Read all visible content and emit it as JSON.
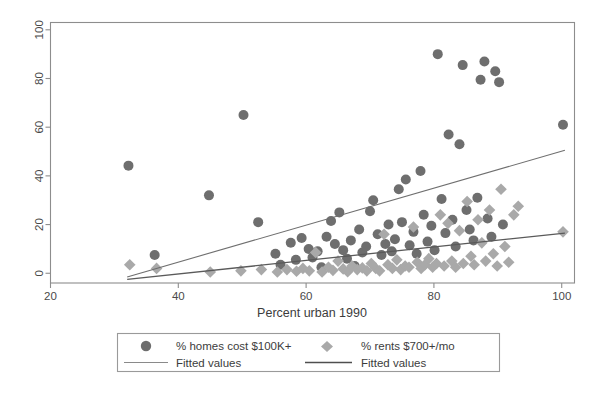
{
  "chart_data": {
    "type": "scatter",
    "title": "",
    "xlabel": "Percent urban 1990",
    "ylabel": "",
    "xlim": [
      20,
      102
    ],
    "ylim": [
      -4,
      103
    ],
    "xticks": [
      20,
      40,
      60,
      80,
      100
    ],
    "yticks": [
      0,
      20,
      40,
      60,
      80,
      100
    ],
    "grid": false,
    "legend_position": "below-plot",
    "series": [
      {
        "name": "% homes cost $100K+",
        "marker": "circle",
        "color": "#6e6e6e",
        "points": [
          [
            32.2,
            44.2
          ],
          [
            36.3,
            7.5
          ],
          [
            44.8,
            32.0
          ],
          [
            50.2,
            65.0
          ],
          [
            52.5,
            21.0
          ],
          [
            55.2,
            8.0
          ],
          [
            56.0,
            3.5
          ],
          [
            57.6,
            12.5
          ],
          [
            58.4,
            5.5
          ],
          [
            59.3,
            14.5
          ],
          [
            60.4,
            10.0
          ],
          [
            61.0,
            6.5
          ],
          [
            61.8,
            9.0
          ],
          [
            62.4,
            2.5
          ],
          [
            63.2,
            15.0
          ],
          [
            63.9,
            21.5
          ],
          [
            64.5,
            12.0
          ],
          [
            65.2,
            25.0
          ],
          [
            65.8,
            9.5
          ],
          [
            66.4,
            6.0
          ],
          [
            67.0,
            13.5
          ],
          [
            67.6,
            3.0
          ],
          [
            68.3,
            18.0
          ],
          [
            68.8,
            8.5
          ],
          [
            69.4,
            11.0
          ],
          [
            70.0,
            25.5
          ],
          [
            70.5,
            30.0
          ],
          [
            71.2,
            16.0
          ],
          [
            71.8,
            7.5
          ],
          [
            72.4,
            12.0
          ],
          [
            72.9,
            20.0
          ],
          [
            73.4,
            9.0
          ],
          [
            73.9,
            14.0
          ],
          [
            74.5,
            34.5
          ],
          [
            75.0,
            21.0
          ],
          [
            75.6,
            38.5
          ],
          [
            76.2,
            11.5
          ],
          [
            76.8,
            17.0
          ],
          [
            77.3,
            8.0
          ],
          [
            77.9,
            42.0
          ],
          [
            78.4,
            24.0
          ],
          [
            79.0,
            13.0
          ],
          [
            79.6,
            19.5
          ],
          [
            80.1,
            9.5
          ],
          [
            80.6,
            90.0
          ],
          [
            81.2,
            30.5
          ],
          [
            81.8,
            16.5
          ],
          [
            82.3,
            57.0
          ],
          [
            82.9,
            22.0
          ],
          [
            83.4,
            11.0
          ],
          [
            84.0,
            53.0
          ],
          [
            84.5,
            85.5
          ],
          [
            85.1,
            26.0
          ],
          [
            85.6,
            18.0
          ],
          [
            86.2,
            13.5
          ],
          [
            86.8,
            31.0
          ],
          [
            87.3,
            79.5
          ],
          [
            87.9,
            87.0
          ],
          [
            88.4,
            22.5
          ],
          [
            89.0,
            15.0
          ],
          [
            89.6,
            83.0
          ],
          [
            90.2,
            78.5
          ],
          [
            90.8,
            20.0
          ],
          [
            100.2,
            61.0
          ]
        ]
      },
      {
        "name": "% rents $700+/mo",
        "marker": "diamond",
        "color": "#a9a9a9",
        "points": [
          [
            32.4,
            3.5
          ],
          [
            36.6,
            2.0
          ],
          [
            45.0,
            0.5
          ],
          [
            49.8,
            1.0
          ],
          [
            53.0,
            1.5
          ],
          [
            55.5,
            0.5
          ],
          [
            57.0,
            1.5
          ],
          [
            58.5,
            0.8
          ],
          [
            59.5,
            2.0
          ],
          [
            60.5,
            1.0
          ],
          [
            61.5,
            8.5
          ],
          [
            62.5,
            0.5
          ],
          [
            63.5,
            2.5
          ],
          [
            64.2,
            1.2
          ],
          [
            65.0,
            5.0
          ],
          [
            65.8,
            1.8
          ],
          [
            66.5,
            0.6
          ],
          [
            67.2,
            3.0
          ],
          [
            68.0,
            1.5
          ],
          [
            68.8,
            2.2
          ],
          [
            69.5,
            1.0
          ],
          [
            70.2,
            4.0
          ],
          [
            70.9,
            2.0
          ],
          [
            71.5,
            1.0
          ],
          [
            72.2,
            16.0
          ],
          [
            72.8,
            3.5
          ],
          [
            73.5,
            2.0
          ],
          [
            74.2,
            5.5
          ],
          [
            74.8,
            1.5
          ],
          [
            75.5,
            3.0
          ],
          [
            76.1,
            2.5
          ],
          [
            76.8,
            19.0
          ],
          [
            77.4,
            4.5
          ],
          [
            78.0,
            2.0
          ],
          [
            78.6,
            3.5
          ],
          [
            79.2,
            6.0
          ],
          [
            79.8,
            2.5
          ],
          [
            80.4,
            4.0
          ],
          [
            81.0,
            24.0
          ],
          [
            81.6,
            3.0
          ],
          [
            82.2,
            20.5
          ],
          [
            82.8,
            5.0
          ],
          [
            83.4,
            2.5
          ],
          [
            84.0,
            17.5
          ],
          [
            84.6,
            4.0
          ],
          [
            85.2,
            29.5
          ],
          [
            85.8,
            7.0
          ],
          [
            86.3,
            3.5
          ],
          [
            86.9,
            22.0
          ],
          [
            87.5,
            12.5
          ],
          [
            88.1,
            5.0
          ],
          [
            88.7,
            26.0
          ],
          [
            89.3,
            8.0
          ],
          [
            89.9,
            3.0
          ],
          [
            90.5,
            34.5
          ],
          [
            91.1,
            11.0
          ],
          [
            91.7,
            4.5
          ],
          [
            92.5,
            24.0
          ],
          [
            93.2,
            27.5
          ],
          [
            100.2,
            17.0
          ]
        ]
      }
    ],
    "fitted_lines": [
      {
        "name": "Fitted values",
        "for_series": "% homes cost $100K+",
        "color": "#6f6f6f",
        "x": [
          32.0,
          100.5
        ],
        "y": [
          -1.5,
          50.5
        ]
      },
      {
        "name": "Fitted values",
        "for_series": "% rents $700+/mo",
        "color": "#5a5a5a",
        "x": [
          32.0,
          100.5
        ],
        "y": [
          -2.5,
          16.5
        ]
      }
    ]
  },
  "axes": {
    "x_tick_labels": [
      "20",
      "40",
      "60",
      "80",
      "100"
    ],
    "y_tick_labels": [
      "0",
      "20",
      "40",
      "60",
      "80",
      "100"
    ],
    "x_axis_title": "Percent urban 1990"
  },
  "legend": {
    "entries": [
      {
        "label": "% homes cost $100K+",
        "marker": "circle-marker",
        "color": "#6e6e6e"
      },
      {
        "label": "% rents $700+/mo",
        "marker": "diamond-marker",
        "color": "#a9a9a9"
      },
      {
        "label": "Fitted values",
        "marker": "line-marker",
        "color": "#8a8a8a"
      },
      {
        "label": "Fitted values",
        "marker": "line-marker",
        "color": "#4f4f4f"
      }
    ]
  }
}
